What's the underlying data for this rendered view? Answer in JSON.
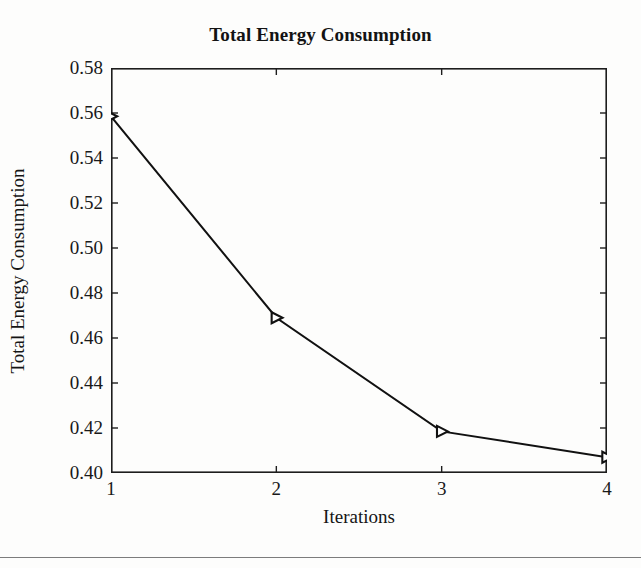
{
  "chart_data": {
    "type": "line",
    "title": "Total Energy Consumption",
    "xlabel": "Iterations",
    "ylabel": "Total Energy Consumption",
    "x": [
      1,
      2,
      3,
      4
    ],
    "values": [
      0.5585,
      0.469,
      0.4185,
      0.407
    ],
    "series": [
      {
        "name": "Total Energy Consumption",
        "x": [
          1,
          2,
          3,
          4
        ],
        "values": [
          0.5585,
          0.469,
          0.4185,
          0.407
        ],
        "marker": "triangle-right",
        "marker_color": "#111111",
        "line_color": "#111111",
        "line_width": 2
      }
    ],
    "xlim": [
      1,
      4
    ],
    "ylim": [
      0.4,
      0.58
    ],
    "xticks": [
      1,
      2,
      3,
      4
    ],
    "xticklabels": [
      "1",
      "2",
      "3",
      "4"
    ],
    "yticks": [
      0.4,
      0.42,
      0.44,
      0.46,
      0.48,
      0.5,
      0.52,
      0.54,
      0.56,
      0.58
    ],
    "yticklabels": [
      "0.40",
      "0.42",
      "0.44",
      "0.46",
      "0.48",
      "0.50",
      "0.52",
      "0.54",
      "0.56",
      "0.58"
    ],
    "grid": false,
    "legend": null,
    "tick_direction": "in",
    "frame": "box",
    "background": "#ffffff"
  },
  "figure": {
    "title": "Total Energy Consumption",
    "xlabel": "Iterations",
    "ylabel": "Total Energy Consumption",
    "frame_color": "#1d1d1d",
    "rule_color": "#7c7c7c"
  }
}
